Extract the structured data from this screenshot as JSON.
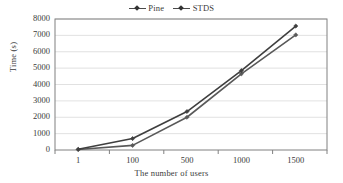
{
  "chart_data": {
    "type": "line",
    "title": "",
    "xlabel": "The number of users",
    "ylabel": "Time (s)",
    "categories": [
      "1",
      "100",
      "500",
      "1000",
      "1500"
    ],
    "series": [
      {
        "name": "Pine",
        "values": [
          30,
          280,
          2000,
          4650,
          7030
        ],
        "color": "#595959",
        "marker": "diamond"
      },
      {
        "name": "STDS",
        "values": [
          40,
          700,
          2350,
          4850,
          7570
        ],
        "color": "#3f3f3f",
        "marker": "diamond"
      }
    ],
    "ylim": [
      0,
      8000
    ],
    "yticks": [
      0,
      1000,
      2000,
      3000,
      4000,
      5000,
      6000,
      7000,
      8000
    ],
    "ytick_labels": [
      "0",
      "1000",
      "2000",
      "3000",
      "4000",
      "5000",
      "6000",
      "7000",
      "8000"
    ],
    "grid": "horizontal",
    "legend_position": "top-center",
    "axis_color": "#808080",
    "grid_color": "#d9d9d9",
    "background": "#ffffff"
  }
}
